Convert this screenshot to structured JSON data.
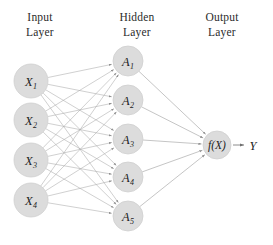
{
  "figure": {
    "type": "neural-network-diagram",
    "background_color": "#ffffff",
    "node_fill": "#dcdcdc",
    "node_stroke": "#cfcfcf",
    "edge_color": "#a9a9a9",
    "text_color": "#1d1d1d"
  },
  "titles": {
    "input": {
      "line1": "Input",
      "line2": "Layer"
    },
    "hidden": {
      "line1": "Hidden",
      "line2": "Layer"
    },
    "output": {
      "line1": "Output",
      "line2": "Layer"
    }
  },
  "layers": {
    "input": {
      "radius": 17,
      "x": 31,
      "nodes": [
        {
          "base": "X",
          "sub": "1",
          "cy": 81
        },
        {
          "base": "X",
          "sub": "2",
          "cy": 120
        },
        {
          "base": "X",
          "sub": "3",
          "cy": 160
        },
        {
          "base": "X",
          "sub": "4",
          "cy": 200
        }
      ]
    },
    "hidden": {
      "radius": 15,
      "x": 128,
      "nodes": [
        {
          "base": "A",
          "sub": "1",
          "cy": 61
        },
        {
          "base": "A",
          "sub": "2",
          "cy": 100
        },
        {
          "base": "A",
          "sub": "3",
          "cy": 139
        },
        {
          "base": "A",
          "sub": "4",
          "cy": 177
        },
        {
          "base": "A",
          "sub": "5",
          "cy": 216
        }
      ]
    },
    "output": {
      "radius": 14,
      "x": 217,
      "cy": 145,
      "label": "f(X)",
      "result_label": "Y",
      "result_x": 253
    }
  },
  "connections": {
    "input_to_hidden": "fully-connected",
    "hidden_to_output": "fully-connected",
    "arrowheads": true,
    "input_to_hidden_count": 20,
    "hidden_to_output_count": 5
  }
}
